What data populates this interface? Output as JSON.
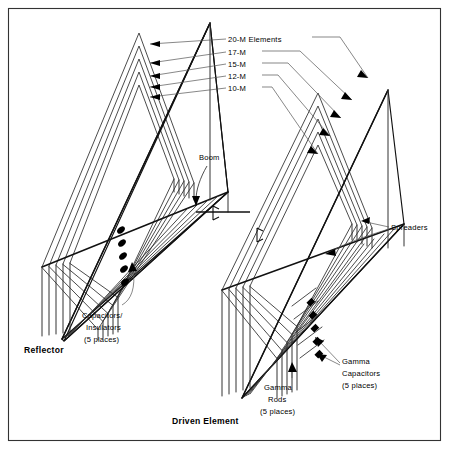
{
  "diagram": {
    "frame": {
      "visible": true,
      "color": "#333333"
    },
    "background_color": "#ffffff",
    "line_color": "#111111"
  },
  "band_labels": [
    {
      "id": "band-20m",
      "text": "20-M Elements"
    },
    {
      "id": "band-17m",
      "text": "17-M"
    },
    {
      "id": "band-15m",
      "text": "15-M"
    },
    {
      "id": "band-12m",
      "text": "12-M"
    },
    {
      "id": "band-10m",
      "text": "10-M"
    }
  ],
  "callouts": {
    "boom": "Boom",
    "spreaders": "Spreaders",
    "capacitors_insulators": {
      "line1": "Capacitors/",
      "line2": "Insulators",
      "line3": "(5 places)"
    },
    "gamma_capacitors": {
      "line1": "Gamma",
      "line2": "Capacitors",
      "line3": "(5 places)"
    },
    "gamma_rods": {
      "line1": "Gamma",
      "line2": "Rods",
      "line3": "(5 places)"
    }
  },
  "element_names": {
    "reflector": "Reflector",
    "driven_element": "Driven Element"
  },
  "counts": {
    "bands": 5,
    "capacitor_places": 5,
    "gamma_capacitor_places": 5,
    "gamma_rod_places": 5
  }
}
